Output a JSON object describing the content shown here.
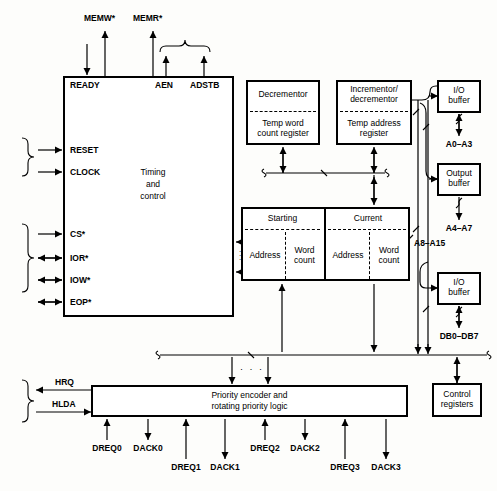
{
  "figure": {
    "type": "block-diagram"
  },
  "blocks": {
    "timing_control": {
      "label": "Timing\nand\ncontrol",
      "line1": "Timing",
      "line2": "and",
      "line3": "control"
    },
    "decrementor": {
      "top": "Decrementor",
      "bottom_line1": "Temp word",
      "bottom_line2": "count register"
    },
    "incrementor": {
      "top_line1": "Incrementor/",
      "top_line2": "decrementor",
      "bottom_line1": "Temp address",
      "bottom_line2": "register"
    },
    "registers": {
      "col1_title": "Starting",
      "col2_title": "Current",
      "cells": [
        "Address",
        "Word\ncount",
        "Address",
        "Word\ncount"
      ],
      "cell1": "Address",
      "cell2_a": "Word",
      "cell2_b": "count",
      "cell3": "Address",
      "cell4_a": "Word",
      "cell4_b": "count"
    },
    "io_buffer_1": {
      "line1": "I/O",
      "line2": "buffer"
    },
    "output_buffer": {
      "line1": "Output",
      "line2": "buffer"
    },
    "io_buffer_2": {
      "line1": "I/O",
      "line2": "buffer"
    },
    "priority": {
      "line1": "Priority encoder and",
      "line2": "rotating priority logic"
    },
    "control_registers": {
      "line1": "Control",
      "line2": "registers"
    }
  },
  "signals": {
    "top": [
      "MEMW*",
      "MEMR*"
    ],
    "timing_pins_top": [
      "READY",
      "AEN",
      "ADSTB"
    ],
    "timing_pins_left": [
      "RESET",
      "CLOCK",
      "CS*",
      "IOR*",
      "IOW*",
      "EOP*"
    ],
    "address_buses": [
      "A0–A3",
      "A4–A7",
      "A8–A15"
    ],
    "data_bus": "DB0–DB7",
    "host": [
      "HRQ",
      "HLDA"
    ],
    "dma_channels": [
      "DREQ0",
      "DACK0",
      "DREQ1",
      "DACK1",
      "DREQ2",
      "DACK2",
      "DREQ3",
      "DACK3"
    ]
  },
  "colors": {
    "stroke": "#000000",
    "background": "#fdfdfb"
  }
}
